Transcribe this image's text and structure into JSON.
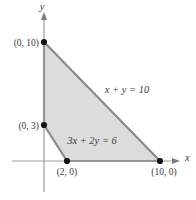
{
  "figure": {
    "title_hint": "Feasible region bounded by x + y = 10 and 3x + 2y = 6",
    "axis_labels": {
      "x": "x",
      "y": "y"
    },
    "equation_labels": {
      "line1": "x + y = 10",
      "line2": "3x + 2y = 6"
    },
    "point_labels": {
      "p0_10": "(0, 10)",
      "p0_3": "(0, 3)",
      "p2_0": "(2, 0)",
      "p10_0": "(10, 0)"
    },
    "vertices": [
      [
        0,
        10
      ],
      [
        10,
        0
      ],
      [
        2,
        0
      ],
      [
        0,
        3
      ]
    ],
    "lines": [
      {
        "equation": "x + y = 10",
        "intercepts": [
          [
            0,
            10
          ],
          [
            10,
            0
          ]
        ]
      },
      {
        "equation": "3x + 2y = 6",
        "intercepts": [
          [
            0,
            3
          ],
          [
            2,
            0
          ]
        ]
      }
    ],
    "colors": {
      "region_fill": "#dcdcdc",
      "region_stroke": "#8a8a8a",
      "axis": "#9e9e9e",
      "point": "#141414",
      "text": "#3a3a3a"
    }
  }
}
